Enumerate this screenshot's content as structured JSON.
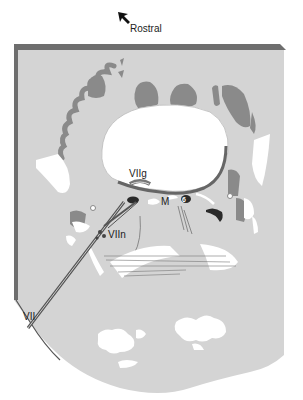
{
  "figure": {
    "orientation": {
      "arrow_icon": "arrow-up-left-icon",
      "label": "Rostral"
    },
    "labels": {
      "viig": "VIIg",
      "m": "M",
      "viin": "VIIn",
      "vii": "VII",
      "six": "6"
    },
    "colors": {
      "background": "#ffffff",
      "tissue": "#d4d4d4",
      "dark_structures": "#8a8a8a",
      "border": "#6e6e6e",
      "cavity": "#ffffff",
      "black_structures": "#2a2a2a",
      "nerve": "#555555"
    }
  }
}
